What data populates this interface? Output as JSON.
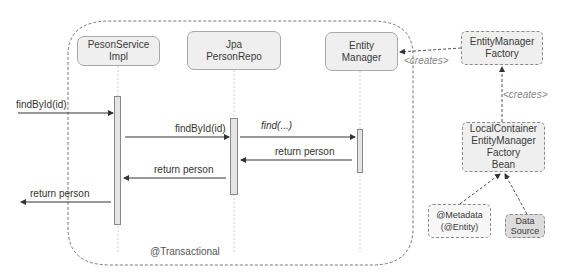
{
  "diagram": {
    "boundary_label": "@Transactional",
    "participants": [
      {
        "id": "service",
        "label_line1": "PesonService",
        "label_line2": "Impl"
      },
      {
        "id": "repo",
        "label_line1": "Jpa",
        "label_line2": "PersonRepo"
      },
      {
        "id": "em",
        "label_line1": "Entity",
        "label_line2": "Manager"
      }
    ],
    "messages": [
      {
        "from": "external",
        "to": "service",
        "label": "findById(id)"
      },
      {
        "from": "service",
        "to": "repo",
        "label": "findById(id)"
      },
      {
        "from": "repo",
        "to": "em",
        "label": "find(...)"
      },
      {
        "from": "em",
        "to": "repo",
        "label": "return person"
      },
      {
        "from": "repo",
        "to": "service",
        "label": "return  person"
      },
      {
        "from": "service",
        "to": "external",
        "label": "return person"
      }
    ],
    "factory_nodes": {
      "emf": {
        "line1": "EntityManager",
        "line2": "Factory"
      },
      "lcemfb": {
        "line1": "LocalContainer",
        "line2": "EntityManager",
        "line3": "Factory",
        "line4": "Bean"
      },
      "metadata": {
        "line1": "@Metadata",
        "line2": "(@Entity)"
      },
      "datasource": {
        "line1": "Data",
        "line2": "Source"
      }
    },
    "relations": [
      {
        "from": "emf",
        "to": "em",
        "label": "<creates>"
      },
      {
        "from": "lcemfb",
        "to": "emf",
        "label": "<creates>"
      },
      {
        "from": "metadata",
        "to": "lcemfb",
        "label": ""
      },
      {
        "from": "datasource",
        "to": "lcemfb",
        "label": ""
      }
    ]
  }
}
